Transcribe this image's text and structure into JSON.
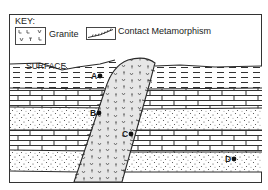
{
  "diagram": {
    "type": "geologic cross-section",
    "key": {
      "title": "KEY:",
      "items": [
        {
          "symbol": "granite-pattern",
          "label": "Granite"
        },
        {
          "symbol": "contact-metamorphism-pattern",
          "label": "Contact Metamorphism"
        }
      ]
    },
    "surface_label": "SURFACE",
    "points": [
      {
        "id": "A",
        "label": "A",
        "location": "shale layer, left of granite intrusion"
      },
      {
        "id": "B",
        "label": "B",
        "location": "sandstone layer adjacent to granite contact (left)"
      },
      {
        "id": "C",
        "label": "C",
        "location": "inside granite intrusion"
      },
      {
        "id": "D",
        "label": "D",
        "location": "lower sandstone layer, far right"
      }
    ],
    "layers_top_to_bottom": [
      "shale",
      "limestone",
      "sandstone",
      "limestone",
      "sandstone"
    ],
    "intrusion": "granite"
  },
  "colors": {
    "line": "#2a2a2a",
    "granite_fill": "#e6e6e6",
    "background": "#ffffff"
  }
}
